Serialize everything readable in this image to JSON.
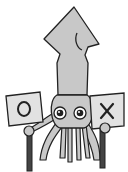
{
  "illustration": {
    "subject": "squid holding two signs",
    "left_sign": {
      "symbol": "O"
    },
    "right_sign": {
      "symbol": "X"
    },
    "colors": {
      "body": "#c8c8c8",
      "outline": "#222222",
      "sign": "#e2e2e2",
      "background": "#ffffff"
    }
  }
}
